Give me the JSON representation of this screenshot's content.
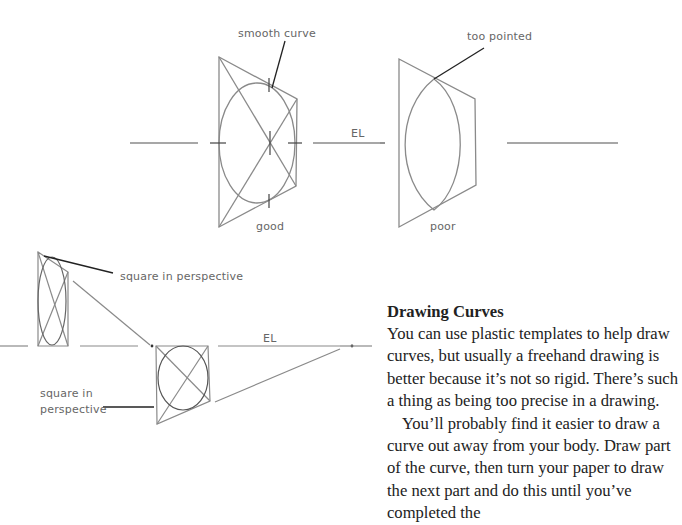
{
  "figure_top": {
    "labels": {
      "smooth_curve": "smooth curve",
      "too_pointed": "too pointed",
      "eye_level": "EL",
      "good": "good",
      "poor": "poor"
    }
  },
  "figure_bottom": {
    "labels": {
      "square_in_perspective_top": "square in perspective",
      "square_in_perspective_left_line1": "square in",
      "square_in_perspective_left_line2": "perspective",
      "eye_level": "EL"
    }
  },
  "article": {
    "heading": "Drawing Curves",
    "paragraphs": [
      "You can use plastic templates to help draw curves, but usually a freehand drawing is bet­ter because it’s not so rigid. There’s such a thing as being too precise in a drawing.",
      "You’ll probably find it easier to draw a curve out away from your body. Draw part of the curve, then turn your paper to draw the next part and do this until you’ve completed the"
    ]
  },
  "colors": {
    "line": "#888888",
    "dark_line": "#333333",
    "text": "#222222"
  }
}
